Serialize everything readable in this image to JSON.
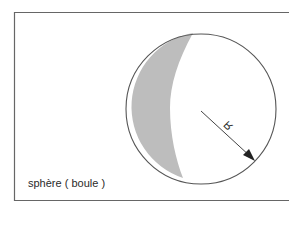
{
  "diagram": {
    "caption": "sphère ( boule )",
    "radius_label": "R",
    "colors": {
      "stroke": "#555555",
      "shade": "#bdbdbd",
      "background": "#ffffff"
    },
    "elements": [
      "frame",
      "circle",
      "shaded-crescent",
      "radius-arrow"
    ]
  }
}
